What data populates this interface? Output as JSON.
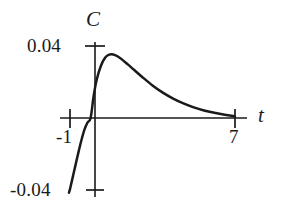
{
  "figure": {
    "background_color": "#ffffff",
    "ink_color": "#1a1a1a",
    "axis_label_y": "C",
    "axis_label_x": "t"
  },
  "labels": {
    "y_max": "0.04",
    "y_min": "-0.04",
    "x_left": "-1",
    "x_right": "7"
  },
  "chart_data": {
    "type": "line",
    "title": "",
    "xlabel": "t",
    "ylabel": "C",
    "xlim": [
      -1.8,
      8.2
    ],
    "ylim": [
      -0.045,
      0.047
    ],
    "grid": false,
    "legend": null,
    "x_ticks": [
      -1,
      7
    ],
    "x_tick_labels": [
      "-1",
      "7"
    ],
    "y_ticks": [
      -0.04,
      0.04
    ],
    "y_tick_labels": [
      "0.04",
      "-0.04"
    ],
    "axis_origin": [
      0,
      0
    ],
    "annotations": [],
    "series": [
      {
        "name": "C(t)",
        "description": "Steep rise from -0.04 near t=-1 crossing zero at t=0, peaking near 0.035 at t about 1.1, then decaying asymptotically toward zero by t=7",
        "x": [
          -1.05,
          -1.0,
          -0.9,
          -0.75,
          -0.6,
          -0.45,
          -0.3,
          -0.15,
          0.0,
          0.15,
          0.3,
          0.5,
          0.7,
          0.9,
          1.1,
          1.3,
          1.5,
          1.8,
          2.1,
          2.5,
          3.0,
          3.5,
          4.0,
          4.5,
          5.0,
          5.5,
          6.0,
          6.5,
          7.0
        ],
        "y": [
          -0.0415,
          -0.0395,
          -0.0345,
          -0.027,
          -0.0195,
          -0.0125,
          -0.0065,
          -0.0025,
          0.0,
          0.0125,
          0.0215,
          0.029,
          0.0335,
          0.0352,
          0.0353,
          0.0343,
          0.0327,
          0.0298,
          0.0268,
          0.0228,
          0.0181,
          0.0141,
          0.0108,
          0.0081,
          0.0059,
          0.0042,
          0.0029,
          0.0018,
          0.0009
        ]
      }
    ]
  },
  "geometry": {
    "x_axis_y_px": 118,
    "x_axis_start_px": 60,
    "x_axis_end_px": 247,
    "y_axis_x_px": 95,
    "y_axis_top_px": 42,
    "y_axis_bottom_px": 197,
    "tick_ymax_y_px": 46,
    "tick_ymin_y_px": 190,
    "tick_xneg1_x_px": 70,
    "tick_x7_x_px": 235,
    "peak_px": [
      120,
      54
    ],
    "curve_entry_px": [
      88,
      197
    ]
  }
}
